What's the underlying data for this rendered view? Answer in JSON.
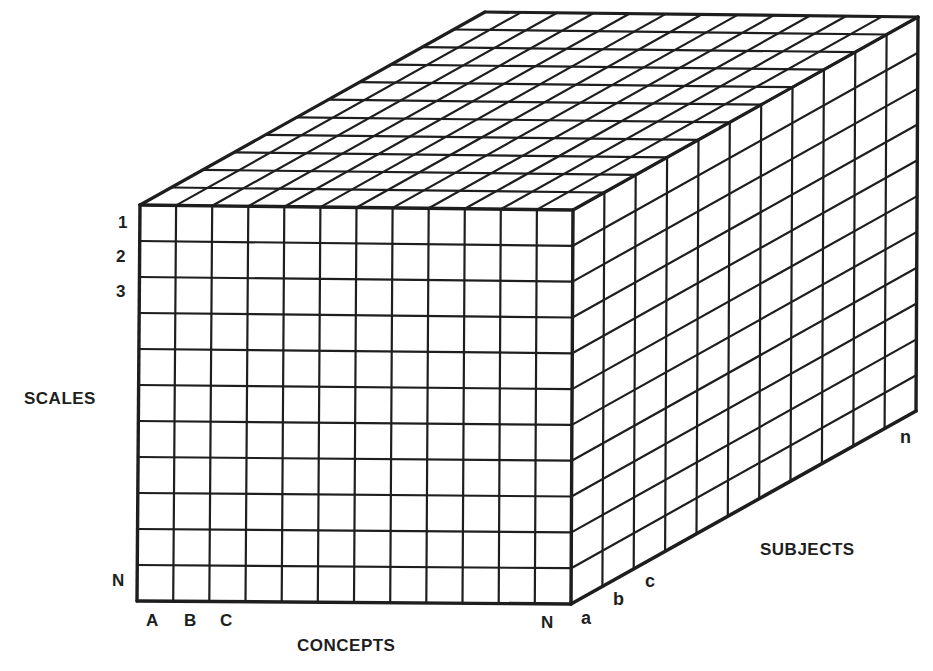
{
  "figure": {
    "line_color": "#1e1e1e",
    "background": "#ffffff",
    "geometry": {
      "front_top_left": [
        140,
        205
      ],
      "front_bottom_left": [
        137,
        601
      ],
      "front_top_right": [
        573,
        210
      ],
      "front_bottom_right": [
        571,
        604
      ],
      "depth_vector": [
        345,
        -193
      ],
      "front_columns": 12,
      "front_rows": 11,
      "depth_cells": 11
    }
  },
  "axes": {
    "scales": {
      "title": "SCALES",
      "ticks": [
        "1",
        "2",
        "3",
        "N"
      ]
    },
    "concepts": {
      "title": "CONCEPTS",
      "ticks": [
        "A",
        "B",
        "C",
        "N"
      ]
    },
    "subjects": {
      "title": "SUBJECTS",
      "ticks": [
        "a",
        "b",
        "c",
        "n"
      ]
    }
  }
}
